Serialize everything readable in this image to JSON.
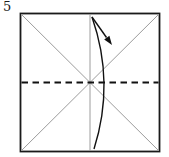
{
  "step": {
    "number": "5"
  },
  "diagram": {
    "name": "origami-fold-in-half-step",
    "elements": {
      "square": "paper-square-outline",
      "creases": [
        "diagonal-crease",
        "anti-diagonal-crease",
        "vertical-center-crease"
      ],
      "fold": "valley-fold-dashed-line",
      "arrow": "fold-and-unfold-arrow"
    },
    "colors": {
      "background": "#ffffff",
      "outline": "#1a1a1a",
      "crease": "#9c9c9c",
      "fold_line": "#111111",
      "arrow": "#111111"
    }
  }
}
